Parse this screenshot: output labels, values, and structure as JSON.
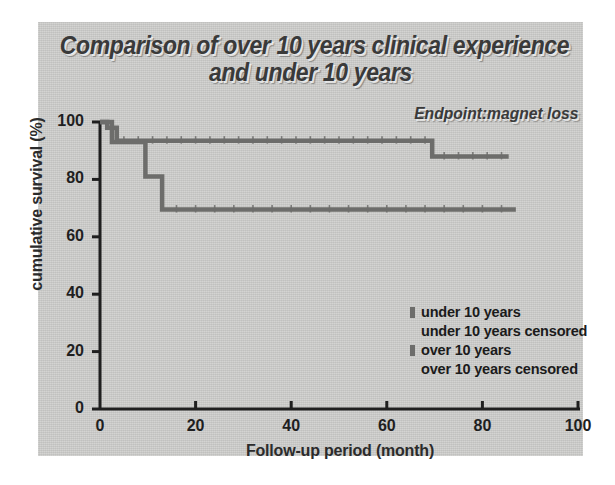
{
  "figure": {
    "title_line1": "Comparison of over 10 years clinical experience",
    "title_line2": "and under 10 years",
    "endpoint": "Endpoint:magnet loss",
    "panel_color": "#cfcfcd",
    "line_color": "#6d6d6b",
    "axis_color": "#1f1f1f"
  },
  "chart_data": {
    "type": "line",
    "title": "Comparison of over 10 years clinical experience and under 10 years",
    "subtitle": "Endpoint:magnet loss",
    "xlabel": "Follow-up period (month)",
    "ylabel": "cumulative survival (%)",
    "xlim": [
      0,
      100
    ],
    "ylim": [
      0,
      100
    ],
    "xticks": [
      0,
      20,
      40,
      60,
      80,
      100
    ],
    "yticks": [
      0,
      20,
      40,
      60,
      80,
      100
    ],
    "grid": false,
    "legend_position": "lower-right",
    "step_style": "post",
    "series": [
      {
        "name": "under 10 years",
        "censored_name": "under 10 years censored",
        "color": "#6d6d6b",
        "x": [
          0,
          1.5,
          3.5,
          69.5,
          85.5
        ],
        "y": [
          100,
          98,
          93.5,
          93.5,
          88
        ],
        "steps": [
          {
            "x": 0,
            "y": 100
          },
          {
            "x": 1.5,
            "y": 98
          },
          {
            "x": 3.5,
            "y": 93.5
          },
          {
            "x": 69.5,
            "y": 88
          },
          {
            "x": 85.5,
            "y": 88
          }
        ],
        "censored_marks": [
          5,
          8,
          11,
          14,
          17,
          20,
          23,
          26,
          29,
          32,
          35,
          38,
          41,
          44,
          47,
          50,
          53,
          56,
          59,
          62,
          65,
          68,
          72,
          75,
          78,
          81,
          84
        ]
      },
      {
        "name": "over 10 years",
        "censored_name": "over 10 years censored",
        "color": "#6d6d6b",
        "x": [
          0,
          2.5,
          9.5,
          13,
          87
        ],
        "y": [
          100,
          93,
          81,
          69.5,
          69.5
        ],
        "steps": [
          {
            "x": 0,
            "y": 100
          },
          {
            "x": 2.5,
            "y": 93
          },
          {
            "x": 9.5,
            "y": 81
          },
          {
            "x": 13,
            "y": 69.5
          },
          {
            "x": 87,
            "y": 69.5
          }
        ],
        "censored_marks": [
          16,
          20,
          24,
          28,
          32,
          36,
          40,
          44,
          48,
          52,
          56,
          60,
          64,
          68,
          72,
          76,
          80,
          84
        ]
      }
    ]
  },
  "legend": {
    "items": [
      {
        "label": "under 10 years",
        "key": "solid"
      },
      {
        "label": "under 10 years censored",
        "key": "blank"
      },
      {
        "label": "over 10 years",
        "key": "solid"
      },
      {
        "label": "over 10 years censored",
        "key": "blank"
      }
    ]
  }
}
